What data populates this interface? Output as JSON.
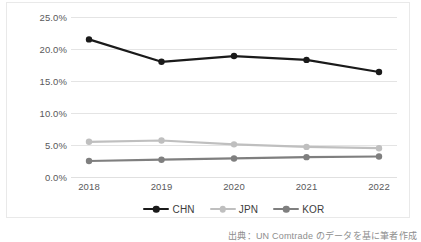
{
  "chart_data": {
    "type": "line",
    "title": "",
    "subtitle": "",
    "xlabel": "",
    "ylabel": "",
    "categories": [
      "2018",
      "2019",
      "2020",
      "2021",
      "2022"
    ],
    "ylim": [
      0,
      25
    ],
    "y_ticks": [
      0,
      5,
      10,
      15,
      20,
      25
    ],
    "y_tick_labels": [
      "0.0%",
      "5.0%",
      "10.0%",
      "15.0%",
      "20.0%",
      "25.0%"
    ],
    "value_format": "percent",
    "grid": "horizontal",
    "legend_position": "bottom-center",
    "markers": "circle",
    "series": [
      {
        "name": "CHN",
        "color": "#1a1a1a",
        "values": [
          21.5,
          18.0,
          18.9,
          18.3,
          16.4
        ]
      },
      {
        "name": "JPN",
        "color": "#bfbfbf",
        "values": [
          5.5,
          5.7,
          5.1,
          4.7,
          4.5
        ]
      },
      {
        "name": "KOR",
        "color": "#7f7f7f",
        "values": [
          2.5,
          2.7,
          2.9,
          3.1,
          3.2
        ]
      }
    ]
  },
  "legend": {
    "items": [
      {
        "label": "CHN"
      },
      {
        "label": "JPN"
      },
      {
        "label": "KOR"
      }
    ]
  },
  "source_note": "出典：UN Comtrade のデータを基に筆者作成"
}
